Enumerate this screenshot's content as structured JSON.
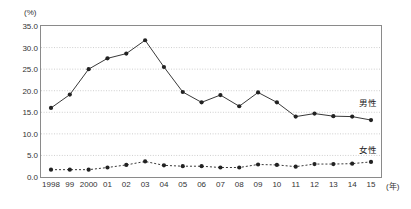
{
  "chart_data": {
    "type": "line",
    "title": "",
    "subtitle": "",
    "xlabel": "(年)",
    "ylabel": "(%)",
    "ylim": [
      0.0,
      35.0
    ],
    "yticks": [
      "0.0",
      "5.0",
      "10.0",
      "15.0",
      "20.0",
      "25.0",
      "30.0",
      "35.0"
    ],
    "ytick_values": [
      0.0,
      5.0,
      10.0,
      15.0,
      20.0,
      25.0,
      30.0,
      35.0
    ],
    "grid": "horizontal-dotted",
    "legend_position": "inline-right",
    "categories": [
      "1998",
      "99",
      "2000",
      "01",
      "02",
      "03",
      "04",
      "05",
      "06",
      "07",
      "08",
      "09",
      "10",
      "11",
      "12",
      "13",
      "14",
      "15"
    ],
    "x": [
      1998,
      1999,
      2000,
      2001,
      2002,
      2003,
      2004,
      2005,
      2006,
      2007,
      2008,
      2009,
      2010,
      2011,
      2012,
      2013,
      2014,
      2015
    ],
    "series": [
      {
        "name": "男性",
        "marker": "filled-circle",
        "linestyle": "solid",
        "color": "#222222",
        "values": [
          16.0,
          19.1,
          25.0,
          27.5,
          28.6,
          31.7,
          25.5,
          19.7,
          17.3,
          19.0,
          16.4,
          19.6,
          17.3,
          14.0,
          14.7,
          14.1,
          14.0,
          13.2
        ]
      },
      {
        "name": "女性",
        "marker": "filled-circle",
        "linestyle": "dotted",
        "color": "#222222",
        "values": [
          1.7,
          1.7,
          1.7,
          2.2,
          2.8,
          3.6,
          2.7,
          2.5,
          2.5,
          2.2,
          2.2,
          2.9,
          2.8,
          2.4,
          3.0,
          3.0,
          3.1,
          3.5
        ]
      }
    ],
    "annotations": [
      {
        "name": "male-series-label",
        "text": "男性"
      },
      {
        "name": "female-series-label",
        "text": "女性"
      }
    ]
  }
}
